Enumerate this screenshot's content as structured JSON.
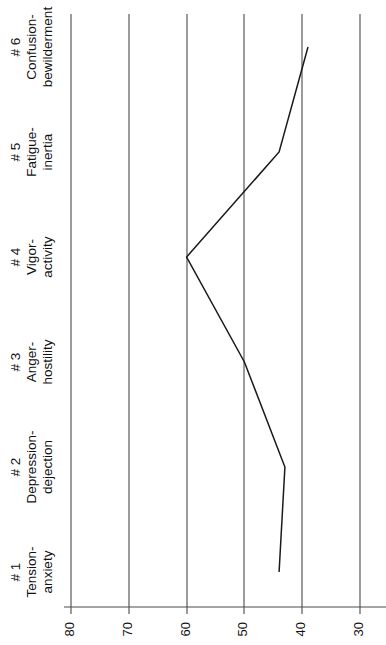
{
  "chart_data": {
    "type": "line",
    "title": "",
    "subtitle": "",
    "orientation": "rotated-90-ccw",
    "xlabel": "",
    "ylabel": "",
    "grid": true,
    "legend": false,
    "legend_position": "none",
    "axis_range": [
      85,
      27
    ],
    "tick_values": [
      80,
      70,
      60,
      50,
      40,
      30
    ],
    "tick_labels": [
      "80",
      "70",
      "60",
      "50",
      "40",
      "30"
    ],
    "categories": [
      "# 1\nTension-\nanxiety",
      "# 2\nDepression-\ndejection",
      "# 3\nAnger-\nhostility",
      "# 4\nVigor-\nactivity",
      "# 5\nFatigue-\ninertia",
      "# 6\nConfusion-\nbewilderment"
    ],
    "category_parts": [
      {
        "number": "# 1",
        "line1": "Tension-",
        "line2": "anxiety"
      },
      {
        "number": "# 2",
        "line1": "Depression-",
        "line2": "dejection"
      },
      {
        "number": "# 3",
        "line1": "Anger-",
        "line2": "hostility"
      },
      {
        "number": "# 4",
        "line1": "Vigor-",
        "line2": "activity"
      },
      {
        "number": "# 5",
        "line1": "Fatigue-",
        "line2": "inertia"
      },
      {
        "number": "# 6",
        "line1": "Confusion-",
        "line2": "bewilderment"
      }
    ],
    "values": [
      44,
      43,
      50,
      60,
      44,
      39
    ],
    "series": [
      {
        "name": "POMS T-score profile",
        "values": [
          44,
          43,
          50,
          60,
          44,
          39
        ]
      }
    ],
    "colors": {
      "line": "#1a1a1a",
      "grid": "#4a4a4a",
      "axis": "#4a4a4a",
      "background": "#ffffff",
      "text": "#111111"
    }
  }
}
